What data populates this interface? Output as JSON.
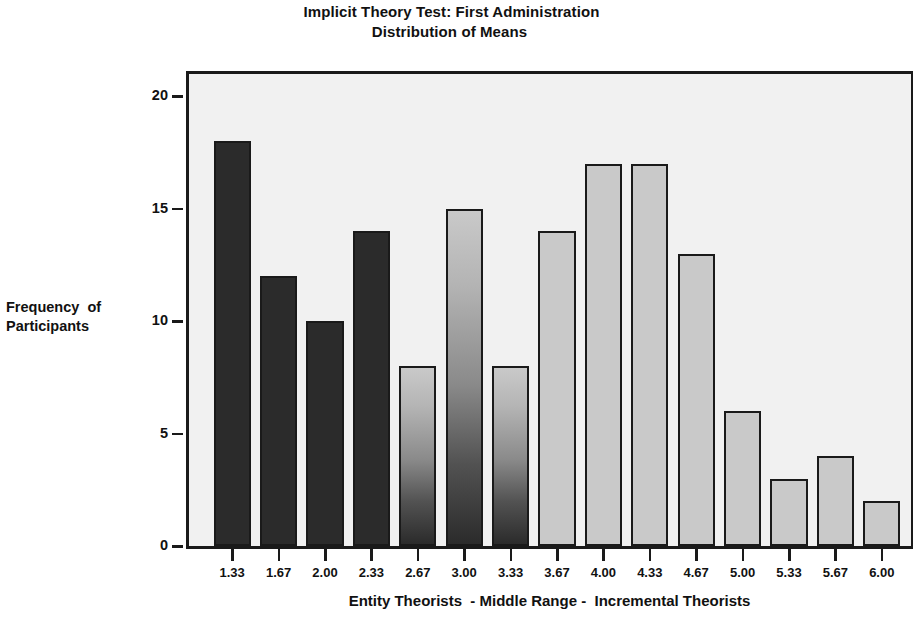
{
  "chart_data": {
    "type": "bar",
    "title": "Implicit Theory Test: First Administration\nDistribution of Means",
    "title_lines": [
      "Implicit Theory Test: First Administration",
      "Distribution of Means"
    ],
    "xlabel": "Entity Theorists  - Middle Range -  Incremental Theorists",
    "ylabel": "Frequency of Participants",
    "ylabel_lines": [
      "Frequency  of",
      "Participants"
    ],
    "categories": [
      "1.33",
      "1.67",
      "2.00",
      "2.33",
      "2.67",
      "3.00",
      "3.33",
      "3.67",
      "4.00",
      "4.33",
      "4.67",
      "5.00",
      "5.33",
      "5.67",
      "6.00"
    ],
    "values": [
      18,
      12,
      10,
      14,
      8,
      15,
      8,
      14,
      17,
      17,
      13,
      6,
      3,
      4,
      2
    ],
    "bar_shades": [
      "dark",
      "dark",
      "dark",
      "dark",
      "gradient",
      "gradient",
      "gradient",
      "light",
      "light",
      "light",
      "light",
      "light",
      "light",
      "light",
      "light"
    ],
    "ylim": [
      0,
      21
    ],
    "yticks": [
      0,
      5,
      10,
      15,
      20
    ],
    "ytick_labels": [
      "0",
      "5",
      "10",
      "15",
      "20"
    ],
    "xtick_labels": [
      "1.33",
      "1.67",
      "2.00",
      "2.33",
      "2.67",
      "3.00",
      "3.33",
      "3.67",
      "4.00",
      "4.33",
      "4.67",
      "5.00",
      "5.33",
      "5.67",
      "6.00"
    ],
    "grid": false,
    "legend": null,
    "legend_position": "none",
    "plot_background": "#f1f1f1",
    "bar_edge_color": "#1a1a1a",
    "bar_dark_color": "#2b2b2b",
    "bar_light_color": "#c9c9c9",
    "text_color": "#111111"
  }
}
